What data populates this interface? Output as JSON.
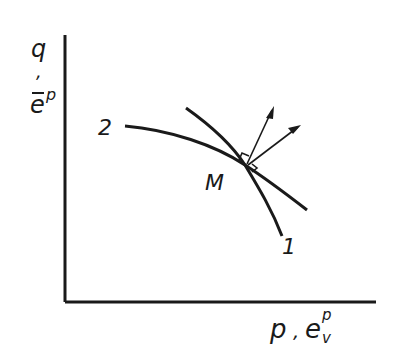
{
  "axes": {
    "y_label_top": "q",
    "y_label_sep": ",",
    "y_label_bottom": "e",
    "y_label_bottom_sup": "p",
    "x_label_main": "p",
    "x_label_sep": ",",
    "x_label_e": "e",
    "x_label_sup": "p",
    "x_label_sub": "v"
  },
  "curves": {
    "curve1_label": "1",
    "curve2_label": "2"
  },
  "point": {
    "label": "M"
  },
  "colors": {
    "ink": "#1a1a1a",
    "background": "#ffffff"
  }
}
